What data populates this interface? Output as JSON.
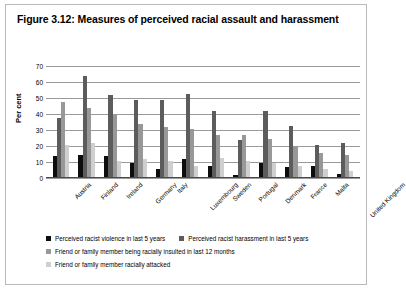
{
  "figure": {
    "title": "Figure 3.12: Measures of perceived racial assault and harassment"
  },
  "chart_data": {
    "type": "bar",
    "title": "Figure 3.12: Measures of perceived racial assault and harassment",
    "xlabel": "",
    "ylabel": "Per cent",
    "ylim": [
      0,
      70
    ],
    "yticks": [
      0,
      10,
      20,
      30,
      40,
      50,
      60,
      70
    ],
    "grid": true,
    "legend_position": "bottom",
    "categories": [
      "Austria",
      "Finland",
      "Ireland",
      "Germany",
      "Italy",
      "Luxembourg",
      "Sweden",
      "Portugal",
      "Denmark",
      "France",
      "Malta",
      "United Kingdom"
    ],
    "series": [
      {
        "name": "Perceived racist violence in last 5 years",
        "color": "#0d0d0d",
        "values": [
          13,
          14,
          13,
          9,
          5,
          11,
          7,
          1,
          9,
          6,
          7,
          2
        ]
      },
      {
        "name": "Perceived racist harassment in last 5 years",
        "color": "#5c5c5c",
        "values": [
          37,
          63,
          51,
          48,
          48,
          52,
          41,
          23,
          41,
          32,
          20,
          21
        ]
      },
      {
        "name": "Friend or family member being racially insulted in last 12 months",
        "color": "#989898",
        "values": [
          47,
          43,
          39,
          33,
          31,
          30,
          26,
          26,
          24,
          19,
          15,
          14
        ]
      },
      {
        "name": "Friend or family member racially attacked",
        "color": "#cfcfcf",
        "values": [
          20,
          21,
          10,
          11,
          10,
          7,
          12,
          10,
          9,
          7,
          5,
          4
        ]
      }
    ]
  }
}
